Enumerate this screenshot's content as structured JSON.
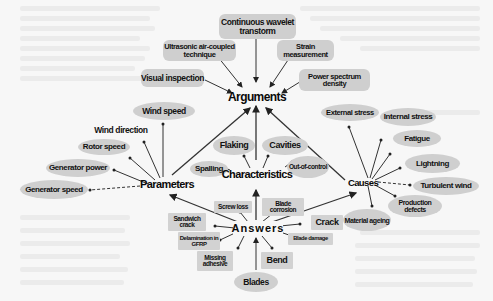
{
  "diagram": {
    "hubs": {
      "arguments": "Arguments",
      "parameters": "Parameters",
      "characteristics": "Characteristics",
      "causes": "Causes",
      "answers": "Answers"
    },
    "arguments_children": {
      "continuous_wavelet": "Continuous wavelet transtorm",
      "ultrasonic": "Ultrasonic air-coupled technique",
      "strain": "Strain measurement",
      "visual": "Visual inspection",
      "power_spectrum": "Power spectrum density"
    },
    "parameters_children": {
      "wind_speed": "Wind speed",
      "wind_direction": "Wind direction",
      "rotor_speed": "Rotor speed",
      "generator_power": "Generator power",
      "generator_speed": "Generator speed"
    },
    "characteristics_children": {
      "flaking": "Flaking",
      "cavities": "Cavities",
      "spalling": "Spalling",
      "out_of_control": "Out-of-control"
    },
    "causes_children": {
      "external_stress": "External stress",
      "internal_stress": "Internal stress",
      "fatigue": "Fatigue",
      "lightning": "Lightning",
      "turbulent_wind": "Turbulent wind",
      "production_defects": "Production defects",
      "material_ageing": "Material ageing"
    },
    "answers_children": {
      "screw_loss": "Screw loss",
      "blade_corrosion": "Blade corrosion",
      "sandwich_crack": "Sandwich crack",
      "crack": "Crack",
      "delamination": "Delamination in GFRP",
      "blade_damage": "Blade damage",
      "missing_adhesive": "Missing adhesive",
      "bend": "Bend",
      "blades": "Blades"
    },
    "colors": {
      "node_fill": "#cfcfcf",
      "edge": "#333333",
      "background": "#f7f7f7"
    }
  }
}
